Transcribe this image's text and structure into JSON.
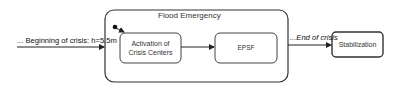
{
  "diagram": {
    "type": "state-diagram",
    "composite_state": {
      "title": "Flood Emergency"
    },
    "states": [
      {
        "id": "activation",
        "label_line1": "Activation of",
        "label_line2": "Crisis Centers"
      },
      {
        "id": "epsf",
        "label": "EPSF"
      },
      {
        "id": "stabilization",
        "label": "Stabilization"
      }
    ],
    "transitions": [
      {
        "from": "external",
        "to": "Flood Emergency",
        "label": "... Beginning of crisis: h=5.5m"
      },
      {
        "from": "initial",
        "to": "activation",
        "label": ""
      },
      {
        "from": "activation",
        "to": "epsf",
        "label": ""
      },
      {
        "from": "Flood Emergency",
        "to": "stabilization",
        "label": "...End of crisis"
      }
    ],
    "colors": {
      "stroke": "#333333",
      "background": "#ffffff",
      "text": "#222222"
    }
  }
}
